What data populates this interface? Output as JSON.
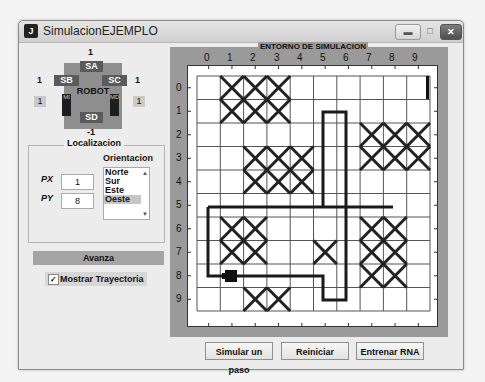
{
  "window": {
    "title": "SimulacionEJEMPLO",
    "icon": "matlab-figure-icon",
    "controls": {
      "minimize": "minimize-icon",
      "maximize": "maximize-icon",
      "close": "close-icon"
    }
  },
  "robot": {
    "title": "ROBOT",
    "sensors": {
      "SA": "SA",
      "SB": "SB",
      "SC": "SC",
      "SD": "SD"
    },
    "sensor_values": {
      "SA": "1",
      "SB": "1",
      "SC": "1",
      "SD": "-1"
    },
    "motors": {
      "left": "MI",
      "right": "MD"
    },
    "motor_values": {
      "left": "1",
      "right": "1"
    }
  },
  "localizacion": {
    "title": "Localizacion",
    "px_label": "PX",
    "py_label": "PY",
    "px_value": "1",
    "py_value": "8",
    "orientacion_label": "Orientacion",
    "options": [
      "Norte",
      "Sur",
      "Este",
      "Oeste"
    ],
    "selected": "Oeste"
  },
  "controls": {
    "avanza_label": "Avanza",
    "mostrar_trayectoria_label": "Mostrar Trayectoria",
    "mostrar_trayectoria_checked": true
  },
  "environment": {
    "title": "ENTORNO DE SIMULACION",
    "x_ticks": [
      "0",
      "1",
      "2",
      "3",
      "4",
      "5",
      "6",
      "7",
      "8",
      "9"
    ],
    "y_ticks": [
      "0",
      "1",
      "2",
      "3",
      "4",
      "5",
      "6",
      "7",
      "8",
      "9"
    ],
    "grid_size": [
      10,
      10
    ],
    "obstacles": [
      [
        0,
        1
      ],
      [
        0,
        2
      ],
      [
        0,
        3
      ],
      [
        1,
        1
      ],
      [
        1,
        2
      ],
      [
        1,
        3
      ],
      [
        2,
        7
      ],
      [
        2,
        8
      ],
      [
        2,
        9
      ],
      [
        3,
        2
      ],
      [
        3,
        3
      ],
      [
        3,
        4
      ],
      [
        3,
        7
      ],
      [
        3,
        8
      ],
      [
        3,
        9
      ],
      [
        4,
        2
      ],
      [
        4,
        3
      ],
      [
        4,
        4
      ],
      [
        6,
        1
      ],
      [
        6,
        2
      ],
      [
        6,
        7
      ],
      [
        6,
        8
      ],
      [
        7,
        1
      ],
      [
        7,
        2
      ],
      [
        7,
        5
      ],
      [
        7,
        7
      ],
      [
        7,
        8
      ],
      [
        8,
        7
      ],
      [
        8,
        8
      ],
      [
        9,
        2
      ],
      [
        9,
        3
      ]
    ],
    "robot_position": {
      "col": 1,
      "row": 8,
      "orientation": "Oeste"
    }
  },
  "buttons": {
    "simular": "Simular un paso",
    "reiniciar": "Reiniciar",
    "entrenar": "Entrenar RNA"
  }
}
